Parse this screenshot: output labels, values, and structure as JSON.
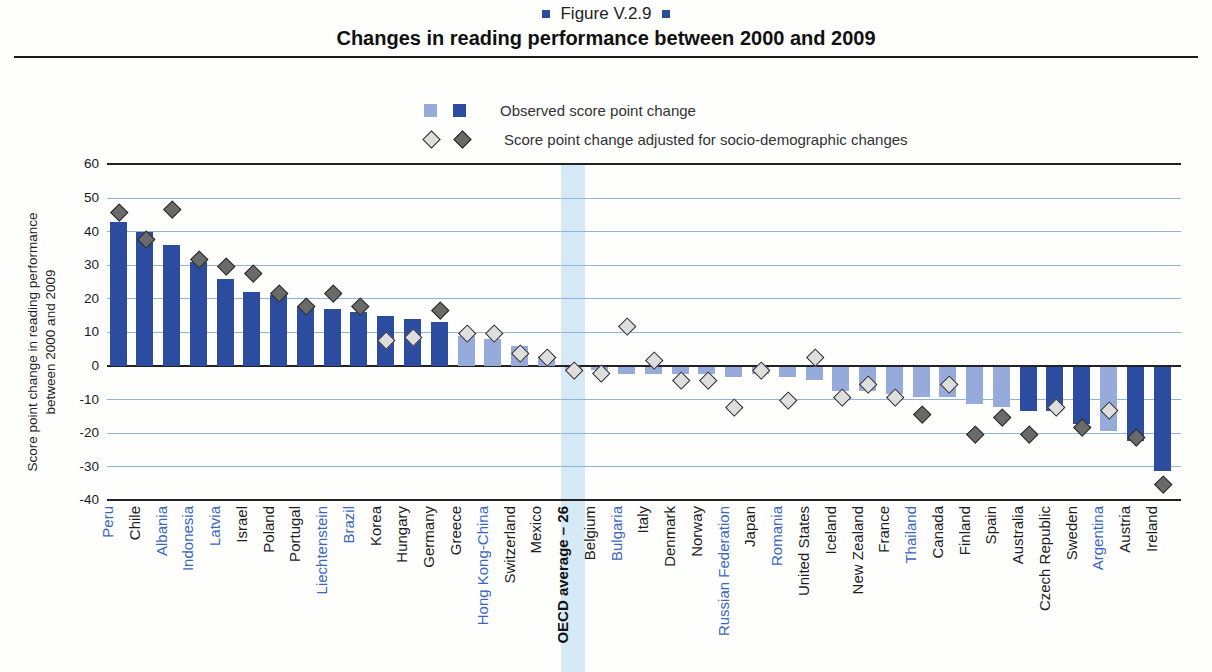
{
  "figure": {
    "tag": "Figure V.2.9",
    "title": "Changes in reading performance between 2000 and 2009"
  },
  "legend": [
    {
      "label": "Observed score point change"
    },
    {
      "label": "Score point change adjusted for socio-demographic changes"
    }
  ],
  "colors": {
    "bar_dark": "#2b4c9f",
    "bar_light": "#96aadb",
    "diamond_dark": "#6a6a6a",
    "diamond_light": "#dedede",
    "diamond_border": "#2a2a2a",
    "grid_blue": "#91b2da",
    "grid_black": "#222222",
    "band_blue": "#d2e7f5",
    "partner_label_blue": "#3a66c2",
    "oecd_label_black": "#111111",
    "title_square_blue": "#2b4da0"
  },
  "chart_data": {
    "type": "bar",
    "title": "Changes in reading performance between 2000 and 2009",
    "xlabel": "",
    "ylabel": "Score point change in reading performance between 2000 and 2009",
    "ylabel_lines": [
      "Score point change in reading performance",
      "between 2000 and 2009"
    ],
    "ylim": [
      -40,
      60
    ],
    "yticks": [
      60,
      50,
      40,
      30,
      20,
      10,
      0,
      -10,
      -20,
      -30,
      -40
    ],
    "grid": "horizontal-only",
    "legend_position": "top-center",
    "highlight_category": "OECD average – 26",
    "series": [
      {
        "name": "Observed score point change",
        "mark": "bar",
        "note": "dark bar = significant change, light bar = not significant"
      },
      {
        "name": "Score point change adjusted for socio-demographic changes",
        "mark": "diamond",
        "note": "dark diamond = significant, light diamond = not significant"
      }
    ],
    "categories": [
      "Peru",
      "Chile",
      "Albania",
      "Indonesia",
      "Latvia",
      "Israel",
      "Poland",
      "Portugal",
      "Liechtenstein",
      "Brazil",
      "Korea",
      "Hungary",
      "Germany",
      "Greece",
      "Hong Kong-China",
      "Switzerland",
      "Mexico",
      "OECD average – 26",
      "Belgium",
      "Bulgaria",
      "Italy",
      "Denmark",
      "Norway",
      "Russian Federation",
      "Japan",
      "Romania",
      "United States",
      "Iceland",
      "New Zealand",
      "France",
      "Thailand",
      "Canada",
      "Finland",
      "Spain",
      "Australia",
      "Czech Republic",
      "Sweden",
      "Argentina",
      "Austria",
      "Ireland"
    ],
    "points": [
      {
        "name": "Peru",
        "partner": true,
        "bar": 43,
        "bar_sig": true,
        "diamond": 46,
        "diamond_sig": true
      },
      {
        "name": "Chile",
        "partner": false,
        "bar": 40,
        "bar_sig": true,
        "diamond": 38,
        "diamond_sig": true
      },
      {
        "name": "Albania",
        "partner": true,
        "bar": 36,
        "bar_sig": true,
        "diamond": 47,
        "diamond_sig": true
      },
      {
        "name": "Indonesia",
        "partner": true,
        "bar": 31,
        "bar_sig": true,
        "diamond": 32,
        "diamond_sig": true
      },
      {
        "name": "Latvia",
        "partner": true,
        "bar": 26,
        "bar_sig": true,
        "diamond": 30,
        "diamond_sig": true
      },
      {
        "name": "Israel",
        "partner": false,
        "bar": 22,
        "bar_sig": true,
        "diamond": 28,
        "diamond_sig": true
      },
      {
        "name": "Poland",
        "partner": false,
        "bar": 21,
        "bar_sig": true,
        "diamond": 22,
        "diamond_sig": true
      },
      {
        "name": "Portugal",
        "partner": false,
        "bar": 18,
        "bar_sig": true,
        "diamond": 18,
        "diamond_sig": true
      },
      {
        "name": "Liechtenstein",
        "partner": true,
        "bar": 17,
        "bar_sig": true,
        "diamond": 22,
        "diamond_sig": true
      },
      {
        "name": "Brazil",
        "partner": true,
        "bar": 16,
        "bar_sig": true,
        "diamond": 18,
        "diamond_sig": true
      },
      {
        "name": "Korea",
        "partner": false,
        "bar": 15,
        "bar_sig": true,
        "diamond": 8,
        "diamond_sig": false
      },
      {
        "name": "Hungary",
        "partner": false,
        "bar": 14,
        "bar_sig": true,
        "diamond": 9,
        "diamond_sig": false
      },
      {
        "name": "Germany",
        "partner": false,
        "bar": 13,
        "bar_sig": true,
        "diamond": 17,
        "diamond_sig": true
      },
      {
        "name": "Greece",
        "partner": false,
        "bar": 9,
        "bar_sig": false,
        "diamond": 10,
        "diamond_sig": false
      },
      {
        "name": "Hong Kong-China",
        "partner": true,
        "bar": 8,
        "bar_sig": false,
        "diamond": 10,
        "diamond_sig": false
      },
      {
        "name": "Switzerland",
        "partner": false,
        "bar": 6,
        "bar_sig": false,
        "diamond": 4,
        "diamond_sig": false
      },
      {
        "name": "Mexico",
        "partner": false,
        "bar": 3,
        "bar_sig": false,
        "diamond": 3,
        "diamond_sig": false
      },
      {
        "name": "OECD average – 26",
        "partner": false,
        "bar": -1,
        "bar_sig": false,
        "diamond": -1,
        "diamond_sig": false
      },
      {
        "name": "Belgium",
        "partner": false,
        "bar": -1,
        "bar_sig": false,
        "diamond": -2,
        "diamond_sig": false
      },
      {
        "name": "Bulgaria",
        "partner": true,
        "bar": -2,
        "bar_sig": false,
        "diamond": 12,
        "diamond_sig": false
      },
      {
        "name": "Italy",
        "partner": false,
        "bar": -2,
        "bar_sig": false,
        "diamond": 2,
        "diamond_sig": false
      },
      {
        "name": "Denmark",
        "partner": false,
        "bar": -2,
        "bar_sig": false,
        "diamond": -4,
        "diamond_sig": false
      },
      {
        "name": "Norway",
        "partner": false,
        "bar": -2,
        "bar_sig": false,
        "diamond": -4,
        "diamond_sig": false
      },
      {
        "name": "Russian Federation",
        "partner": true,
        "bar": -3,
        "bar_sig": false,
        "diamond": -12,
        "diamond_sig": false
      },
      {
        "name": "Japan",
        "partner": false,
        "bar": -2,
        "bar_sig": false,
        "diamond": -1,
        "diamond_sig": false
      },
      {
        "name": "Romania",
        "partner": true,
        "bar": -3,
        "bar_sig": false,
        "diamond": -10,
        "diamond_sig": false
      },
      {
        "name": "United States",
        "partner": false,
        "bar": -4,
        "bar_sig": false,
        "diamond": 3,
        "diamond_sig": false
      },
      {
        "name": "Iceland",
        "partner": false,
        "bar": -7,
        "bar_sig": false,
        "diamond": -9,
        "diamond_sig": false
      },
      {
        "name": "New Zealand",
        "partner": false,
        "bar": -7,
        "bar_sig": false,
        "diamond": -5,
        "diamond_sig": false
      },
      {
        "name": "France",
        "partner": false,
        "bar": -8,
        "bar_sig": false,
        "diamond": -9,
        "diamond_sig": false
      },
      {
        "name": "Thailand",
        "partner": true,
        "bar": -9,
        "bar_sig": false,
        "diamond": -14,
        "diamond_sig": true
      },
      {
        "name": "Canada",
        "partner": false,
        "bar": -9,
        "bar_sig": false,
        "diamond": -5,
        "diamond_sig": false
      },
      {
        "name": "Finland",
        "partner": false,
        "bar": -11,
        "bar_sig": false,
        "diamond": -20,
        "diamond_sig": true
      },
      {
        "name": "Spain",
        "partner": false,
        "bar": -12,
        "bar_sig": false,
        "diamond": -15,
        "diamond_sig": true
      },
      {
        "name": "Australia",
        "partner": false,
        "bar": -13,
        "bar_sig": true,
        "diamond": -20,
        "diamond_sig": true
      },
      {
        "name": "Czech Republic",
        "partner": false,
        "bar": -13,
        "bar_sig": true,
        "diamond": -12,
        "diamond_sig": false
      },
      {
        "name": "Sweden",
        "partner": false,
        "bar": -17,
        "bar_sig": true,
        "diamond": -18,
        "diamond_sig": true
      },
      {
        "name": "Argentina",
        "partner": true,
        "bar": -19,
        "bar_sig": false,
        "diamond": -13,
        "diamond_sig": false
      },
      {
        "name": "Austria",
        "partner": false,
        "bar": -22,
        "bar_sig": true,
        "diamond": -21,
        "diamond_sig": true
      },
      {
        "name": "Ireland",
        "partner": false,
        "bar": -31,
        "bar_sig": true,
        "diamond": -35,
        "diamond_sig": true
      }
    ]
  }
}
